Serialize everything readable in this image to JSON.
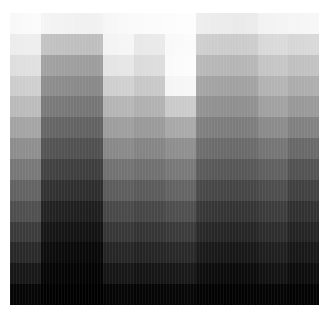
{
  "figure": {
    "background_color": "#ffffff",
    "plot_left": 10,
    "plot_top": 13,
    "plot_width": 310,
    "plot_height": 292
  },
  "chart_data": {
    "type": "heatmap",
    "title": "",
    "subtitle": "",
    "xlabel": "",
    "ylabel": "",
    "legend": [],
    "annotations": [],
    "grid": false,
    "axes_visible": false,
    "tick_labels_visible": false,
    "xticklabels": [],
    "yticklabels": [],
    "colormap": "gray",
    "value_range": [
      0,
      255
    ],
    "color_low": "#000000",
    "color_high": "#ffffff",
    "n_rows": 14,
    "n_cols": 100,
    "values": [
      [
        248,
        248,
        249,
        249,
        250,
        250,
        250,
        251,
        251,
        251,
        245,
        244,
        244,
        243,
        243,
        243,
        243,
        242,
        242,
        242,
        242,
        241,
        241,
        241,
        241,
        241,
        241,
        241,
        242,
        242,
        246,
        247,
        247,
        248,
        248,
        249,
        249,
        249,
        250,
        250,
        250,
        250,
        250,
        251,
        251,
        251,
        251,
        251,
        251,
        252,
        252,
        252,
        252,
        252,
        253,
        253,
        253,
        253,
        253,
        253,
        238,
        238,
        237,
        237,
        237,
        236,
        236,
        236,
        236,
        235,
        235,
        235,
        234,
        234,
        234,
        234,
        235,
        235,
        235,
        235,
        242,
        242,
        243,
        243,
        243,
        243,
        244,
        244,
        244,
        244,
        245,
        245,
        245,
        245,
        246,
        246,
        246,
        247,
        247,
        247
      ],
      [
        236,
        236,
        237,
        237,
        237,
        238,
        238,
        238,
        238,
        238,
        196,
        195,
        195,
        194,
        194,
        193,
        193,
        193,
        192,
        192,
        192,
        191,
        191,
        191,
        191,
        190,
        190,
        190,
        191,
        191,
        243,
        243,
        244,
        244,
        244,
        245,
        245,
        245,
        246,
        246,
        232,
        232,
        232,
        233,
        233,
        233,
        234,
        234,
        234,
        234,
        249,
        249,
        249,
        250,
        250,
        250,
        251,
        251,
        251,
        251,
        208,
        207,
        207,
        206,
        206,
        205,
        205,
        205,
        204,
        204,
        204,
        203,
        203,
        203,
        204,
        204,
        204,
        205,
        205,
        205,
        216,
        216,
        217,
        217,
        217,
        218,
        218,
        218,
        219,
        219,
        214,
        214,
        215,
        215,
        215,
        216,
        216,
        216,
        217,
        217
      ],
      [
        222,
        222,
        223,
        223,
        223,
        224,
        224,
        224,
        224,
        225,
        163,
        162,
        162,
        161,
        161,
        160,
        160,
        160,
        159,
        159,
        159,
        158,
        158,
        158,
        158,
        157,
        157,
        157,
        158,
        158,
        228,
        228,
        229,
        229,
        229,
        230,
        230,
        230,
        231,
        231,
        219,
        219,
        219,
        220,
        220,
        220,
        221,
        221,
        221,
        221,
        250,
        250,
        250,
        251,
        251,
        251,
        252,
        252,
        252,
        252,
        186,
        185,
        185,
        184,
        184,
        183,
        183,
        183,
        182,
        182,
        182,
        181,
        181,
        181,
        182,
        182,
        182,
        183,
        183,
        183,
        196,
        196,
        197,
        197,
        197,
        198,
        198,
        198,
        199,
        199,
        192,
        192,
        193,
        193,
        193,
        194,
        194,
        194,
        195,
        195
      ],
      [
        205,
        205,
        206,
        206,
        206,
        207,
        207,
        207,
        207,
        208,
        143,
        142,
        142,
        141,
        141,
        140,
        140,
        140,
        139,
        139,
        139,
        138,
        138,
        138,
        138,
        137,
        137,
        137,
        138,
        138,
        206,
        206,
        207,
        207,
        207,
        208,
        208,
        208,
        209,
        209,
        199,
        199,
        199,
        200,
        200,
        200,
        201,
        201,
        201,
        201,
        245,
        245,
        245,
        246,
        246,
        246,
        247,
        247,
        247,
        247,
        166,
        165,
        165,
        164,
        164,
        163,
        163,
        163,
        162,
        162,
        162,
        161,
        161,
        161,
        162,
        162,
        162,
        163,
        163,
        163,
        178,
        178,
        179,
        179,
        179,
        180,
        180,
        180,
        181,
        181,
        172,
        172,
        173,
        173,
        173,
        174,
        174,
        174,
        175,
        175
      ],
      [
        186,
        186,
        187,
        187,
        187,
        188,
        188,
        188,
        188,
        189,
        124,
        123,
        123,
        122,
        122,
        121,
        121,
        121,
        120,
        120,
        120,
        119,
        119,
        119,
        119,
        118,
        118,
        118,
        119,
        119,
        180,
        180,
        181,
        181,
        181,
        182,
        182,
        182,
        183,
        183,
        176,
        176,
        176,
        177,
        177,
        177,
        178,
        178,
        178,
        178,
        202,
        202,
        202,
        203,
        203,
        203,
        204,
        204,
        204,
        204,
        148,
        147,
        147,
        146,
        146,
        145,
        145,
        145,
        144,
        144,
        144,
        143,
        143,
        143,
        144,
        144,
        144,
        145,
        145,
        145,
        160,
        160,
        161,
        161,
        161,
        162,
        162,
        162,
        163,
        163,
        152,
        152,
        153,
        153,
        153,
        154,
        154,
        154,
        155,
        155
      ],
      [
        163,
        163,
        164,
        164,
        164,
        165,
        165,
        165,
        165,
        166,
        104,
        103,
        103,
        102,
        102,
        101,
        101,
        101,
        100,
        100,
        100,
        99,
        99,
        99,
        99,
        98,
        98,
        98,
        99,
        99,
        157,
        157,
        158,
        158,
        158,
        159,
        159,
        159,
        160,
        160,
        153,
        153,
        153,
        154,
        154,
        154,
        155,
        155,
        155,
        155,
        168,
        168,
        168,
        169,
        169,
        169,
        170,
        170,
        170,
        170,
        129,
        128,
        128,
        127,
        127,
        126,
        126,
        126,
        125,
        125,
        125,
        124,
        124,
        124,
        125,
        125,
        125,
        126,
        126,
        126,
        138,
        138,
        139,
        139,
        139,
        140,
        140,
        140,
        141,
        141,
        128,
        128,
        129,
        129,
        129,
        130,
        130,
        130,
        131,
        131
      ],
      [
        141,
        141,
        142,
        142,
        142,
        143,
        143,
        143,
        143,
        144,
        86,
        85,
        85,
        84,
        84,
        83,
        83,
        83,
        82,
        82,
        82,
        81,
        81,
        81,
        81,
        80,
        80,
        80,
        81,
        81,
        136,
        136,
        137,
        137,
        137,
        138,
        138,
        138,
        139,
        139,
        132,
        132,
        132,
        133,
        133,
        133,
        134,
        134,
        134,
        134,
        142,
        142,
        142,
        143,
        143,
        143,
        144,
        144,
        144,
        144,
        111,
        110,
        110,
        109,
        109,
        108,
        108,
        108,
        107,
        107,
        107,
        106,
        106,
        106,
        107,
        107,
        107,
        108,
        108,
        108,
        116,
        116,
        117,
        117,
        117,
        118,
        118,
        118,
        119,
        119,
        104,
        104,
        105,
        105,
        105,
        106,
        106,
        106,
        107,
        107
      ],
      [
        119,
        119,
        120,
        120,
        120,
        121,
        121,
        121,
        121,
        122,
        68,
        67,
        67,
        66,
        66,
        65,
        65,
        65,
        64,
        64,
        64,
        63,
        63,
        63,
        63,
        62,
        62,
        62,
        63,
        63,
        113,
        113,
        114,
        114,
        114,
        115,
        115,
        115,
        116,
        116,
        111,
        111,
        111,
        112,
        112,
        112,
        113,
        113,
        113,
        113,
        120,
        120,
        120,
        121,
        121,
        121,
        122,
        122,
        122,
        122,
        92,
        91,
        91,
        90,
        90,
        89,
        89,
        89,
        88,
        88,
        88,
        87,
        87,
        87,
        88,
        88,
        88,
        89,
        89,
        89,
        95,
        95,
        96,
        96,
        96,
        97,
        97,
        97,
        98,
        98,
        82,
        82,
        83,
        83,
        83,
        84,
        84,
        84,
        85,
        85
      ],
      [
        98,
        98,
        99,
        99,
        99,
        100,
        100,
        100,
        100,
        101,
        52,
        51,
        51,
        50,
        50,
        49,
        49,
        49,
        48,
        48,
        48,
        47,
        47,
        47,
        47,
        46,
        46,
        46,
        47,
        47,
        92,
        92,
        93,
        93,
        93,
        94,
        94,
        94,
        95,
        95,
        90,
        90,
        90,
        91,
        91,
        91,
        92,
        92,
        92,
        92,
        99,
        99,
        99,
        100,
        100,
        100,
        101,
        101,
        101,
        101,
        74,
        73,
        73,
        72,
        72,
        71,
        71,
        71,
        70,
        70,
        70,
        69,
        69,
        69,
        70,
        70,
        70,
        71,
        71,
        71,
        76,
        76,
        77,
        77,
        77,
        78,
        78,
        78,
        79,
        79,
        64,
        64,
        65,
        65,
        65,
        66,
        66,
        66,
        67,
        67
      ],
      [
        78,
        78,
        79,
        79,
        79,
        80,
        80,
        80,
        80,
        81,
        36,
        35,
        35,
        34,
        34,
        33,
        33,
        33,
        32,
        32,
        32,
        31,
        31,
        31,
        31,
        30,
        30,
        30,
        31,
        31,
        72,
        72,
        73,
        73,
        73,
        74,
        74,
        74,
        75,
        75,
        70,
        70,
        70,
        71,
        71,
        71,
        72,
        72,
        72,
        72,
        78,
        78,
        78,
        79,
        79,
        79,
        80,
        80,
        80,
        80,
        57,
        56,
        56,
        55,
        55,
        54,
        54,
        54,
        53,
        53,
        53,
        52,
        52,
        52,
        53,
        53,
        53,
        54,
        54,
        54,
        59,
        59,
        60,
        60,
        60,
        61,
        61,
        61,
        62,
        62,
        48,
        48,
        49,
        49,
        49,
        50,
        50,
        50,
        51,
        51
      ],
      [
        58,
        58,
        59,
        59,
        59,
        60,
        60,
        60,
        60,
        61,
        24,
        23,
        23,
        22,
        22,
        21,
        21,
        21,
        20,
        20,
        20,
        19,
        19,
        19,
        19,
        18,
        18,
        18,
        19,
        19,
        54,
        54,
        55,
        55,
        55,
        56,
        56,
        56,
        57,
        57,
        52,
        52,
        52,
        53,
        53,
        53,
        54,
        54,
        54,
        54,
        58,
        58,
        58,
        59,
        59,
        59,
        60,
        60,
        60,
        60,
        42,
        41,
        41,
        40,
        40,
        39,
        39,
        39,
        38,
        38,
        38,
        37,
        37,
        37,
        38,
        38,
        38,
        39,
        39,
        39,
        44,
        44,
        45,
        45,
        45,
        46,
        46,
        46,
        47,
        47,
        35,
        35,
        36,
        36,
        36,
        37,
        37,
        37,
        38,
        38
      ],
      [
        40,
        40,
        41,
        41,
        41,
        42,
        42,
        42,
        42,
        43,
        14,
        13,
        13,
        12,
        12,
        11,
        11,
        11,
        10,
        10,
        10,
        9,
        9,
        9,
        9,
        8,
        8,
        8,
        9,
        9,
        37,
        37,
        38,
        38,
        38,
        39,
        39,
        39,
        40,
        40,
        36,
        36,
        36,
        37,
        37,
        37,
        38,
        38,
        38,
        38,
        40,
        40,
        40,
        41,
        41,
        41,
        42,
        42,
        42,
        42,
        28,
        27,
        27,
        26,
        26,
        25,
        25,
        25,
        24,
        24,
        24,
        23,
        23,
        23,
        24,
        24,
        24,
        25,
        25,
        25,
        30,
        30,
        31,
        31,
        31,
        32,
        32,
        32,
        33,
        33,
        23,
        23,
        24,
        24,
        24,
        25,
        25,
        25,
        26,
        26
      ],
      [
        22,
        22,
        23,
        23,
        23,
        24,
        24,
        24,
        24,
        25,
        6,
        6,
        6,
        5,
        5,
        5,
        5,
        5,
        4,
        4,
        4,
        4,
        4,
        4,
        4,
        3,
        3,
        3,
        4,
        4,
        21,
        21,
        22,
        22,
        22,
        23,
        23,
        23,
        24,
        24,
        20,
        20,
        20,
        21,
        21,
        21,
        22,
        22,
        22,
        22,
        23,
        23,
        23,
        24,
        24,
        24,
        25,
        25,
        25,
        25,
        15,
        14,
        14,
        13,
        13,
        12,
        12,
        12,
        11,
        11,
        11,
        10,
        10,
        10,
        11,
        11,
        11,
        12,
        12,
        12,
        17,
        17,
        18,
        18,
        18,
        19,
        19,
        19,
        20,
        20,
        12,
        12,
        13,
        13,
        13,
        14,
        14,
        14,
        15,
        15
      ],
      [
        5,
        5,
        5,
        5,
        5,
        6,
        6,
        6,
        6,
        6,
        1,
        1,
        1,
        1,
        1,
        1,
        1,
        1,
        0,
        0,
        0,
        0,
        0,
        0,
        0,
        0,
        0,
        0,
        0,
        0,
        5,
        5,
        5,
        5,
        5,
        6,
        6,
        6,
        6,
        6,
        4,
        4,
        4,
        5,
        5,
        5,
        5,
        5,
        5,
        5,
        6,
        6,
        6,
        6,
        6,
        6,
        7,
        7,
        7,
        7,
        3,
        3,
        3,
        3,
        3,
        2,
        2,
        2,
        2,
        2,
        2,
        2,
        2,
        2,
        2,
        2,
        2,
        3,
        3,
        3,
        4,
        4,
        4,
        4,
        4,
        5,
        5,
        5,
        5,
        5,
        2,
        2,
        3,
        3,
        3,
        3,
        3,
        3,
        4,
        4
      ]
    ]
  }
}
